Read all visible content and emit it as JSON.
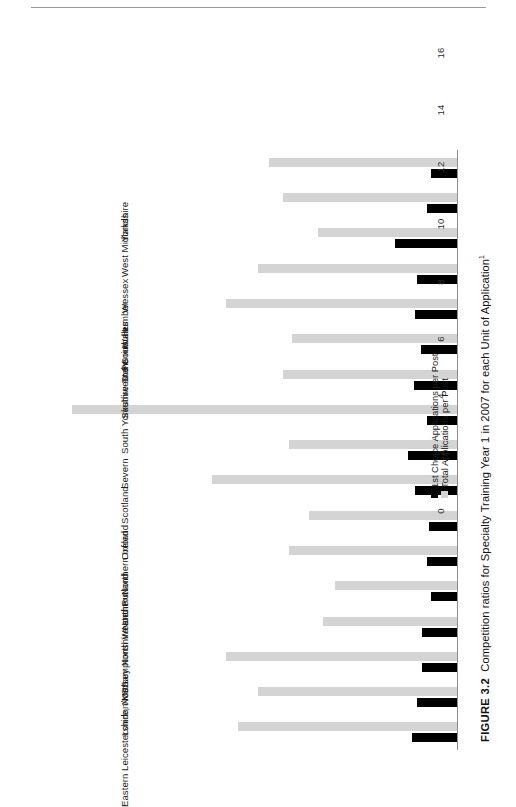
{
  "page": {
    "rule": "horizontal-rule"
  },
  "caption": {
    "number": "FIGURE 3.2",
    "text": "Competition ratios for Specialty Training Year 1 in 2007 for each Unit of Application",
    "footnote_marker": "1"
  },
  "legend": {
    "position": "bottom-right",
    "items": [
      {
        "label": "1st Choice Applications per Post",
        "color": "#000000",
        "key": "first_choice"
      },
      {
        "label": "Total Applications per Post",
        "color": "#d4d4d4",
        "key": "total"
      }
    ]
  },
  "axis": {
    "ticks": [
      "0",
      "2",
      "4",
      "6",
      "8",
      "10",
      "12",
      "14",
      "16"
    ],
    "min": 0,
    "max": 16
  },
  "chart_data": {
    "type": "bar",
    "title": "Competition ratios for Specialty Training Year 1 in 2007 for each Unit of Application",
    "orientation": "vertical-bars-rotated-90",
    "xlabel": "",
    "ylabel": "",
    "ylim": [
      0,
      16
    ],
    "yticks": [
      0,
      2,
      4,
      6,
      8,
      10,
      12,
      14,
      16
    ],
    "grid": false,
    "legend_position": "bottom-right",
    "categories": [
      "Yorkshire",
      "West Midlands",
      "Wessex",
      "Wales",
      "Trent",
      "Southwest Peninsula",
      "South Yorkshire and South Humber",
      "Severn",
      "Scotland",
      "Oxford",
      "Northern Ireland",
      "Northern",
      "North Western",
      "Mersey",
      "London/KSS",
      "Leicestershire, Northamptonshire and Rutland",
      "Eastern"
    ],
    "series": [
      {
        "name": "1st Choice Applications per Post",
        "color": "#000000",
        "values": [
          1.6,
          1.45,
          1.25,
          1.25,
          0.95,
          1.1,
          1.0,
          1.5,
          1.75,
          1.1,
          1.55,
          1.3,
          1.5,
          1.45,
          2.2,
          1.1,
          0.95
        ]
      },
      {
        "name": "Total Applications per Post",
        "color": "#d4d4d4",
        "values": [
          7.7,
          7.0,
          8.1,
          4.7,
          4.3,
          5.9,
          5.2,
          8.6,
          5.9,
          13.5,
          6.1,
          5.8,
          8.1,
          7.0,
          4.9,
          6.1,
          6.6
        ]
      }
    ]
  }
}
